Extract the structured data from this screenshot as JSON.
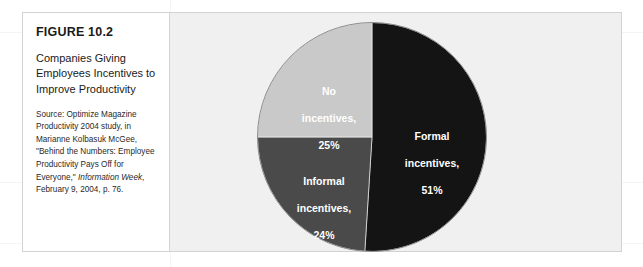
{
  "figure": {
    "number": "FIGURE 10.2",
    "title": "Companies Giving Employees Incentives to Improve Productivity",
    "source_prefix": "Source: Optimize Magazine Productivity 2004 study, in Marianne Kolbasuk McGee, \"Behind the Numbers: Employee Productivity Pays Off for Everyone,\" ",
    "source_italic": "Information Week",
    "source_suffix": ", February 9, 2004, p. 76."
  },
  "chart_data": {
    "type": "pie",
    "title": "Companies Giving Employees Incentives to Improve Productivity",
    "categories": [
      "Formal incentives",
      "Informal incentives",
      "No incentives"
    ],
    "values": [
      51,
      24,
      25
    ],
    "unit": "%",
    "start_angle_deg": 0,
    "direction": "clockwise",
    "legend": "none",
    "labels": [
      "Formal incentives, 51%",
      "Informal incentives, 24%",
      "No incentives, 25%"
    ],
    "slices": [
      {
        "name": "Formal incentives",
        "value": 51,
        "label_line1": "Formal",
        "label_line2": "incentives,",
        "label_line3": "51%",
        "color": "#141414",
        "label_color": "#ffffff",
        "start_deg": 0,
        "end_deg": 183.6
      },
      {
        "name": "Informal incentives",
        "value": 24,
        "label_line1": "Informal",
        "label_line2": "incentives,",
        "label_line3": "24%",
        "color": "#4a4a4a",
        "label_color": "#ffffff",
        "start_deg": 183.6,
        "end_deg": 270
      },
      {
        "name": "No incentives",
        "value": 25,
        "label_line1": "No",
        "label_line2": "incentives,",
        "label_line3": "25%",
        "color": "#c9c9c9",
        "label_color": "#ffffff",
        "start_deg": 270,
        "end_deg": 360
      }
    ]
  },
  "colors": {
    "panel_background": "#f0f0f0",
    "frame_border": "#d2d2d2",
    "text": "#1a1a1a"
  }
}
